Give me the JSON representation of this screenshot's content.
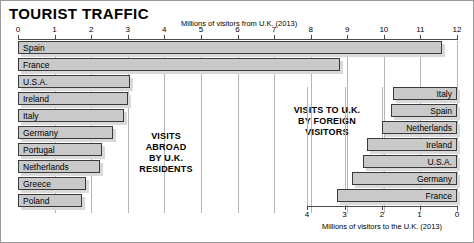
{
  "title": "TOURIST TRAFFIC",
  "captions": {
    "left": "VISITS\nABROAD\nBY U.K.\nRESIDENTS",
    "right": "VISITS TO U.K.\nBY FOREIGN\nVISITORS"
  },
  "chart_data": [
    {
      "type": "bar",
      "orientation": "horizontal",
      "title": "VISITS ABROAD BY U.K. RESIDENTS",
      "xlabel": "Millions of visitors from U.K. (2013)",
      "ylabel": "",
      "xlim": [
        0,
        12
      ],
      "xticks": [
        0,
        1,
        2,
        3,
        4,
        5,
        6,
        7,
        8,
        9,
        10,
        11,
        12
      ],
      "grid": true,
      "axis_position": "top",
      "categories": [
        "Spain",
        "France",
        "U.S.A.",
        "Ireland",
        "Italy",
        "Germany",
        "Portugal",
        "Netherlands",
        "Greece",
        "Poland"
      ],
      "values": [
        11.6,
        8.8,
        3.05,
        3.0,
        2.9,
        2.6,
        2.3,
        2.25,
        1.85,
        1.75
      ]
    },
    {
      "type": "bar",
      "orientation": "horizontal",
      "title": "VISITS TO U.K. BY FOREIGN VISITORS",
      "xlabel": "Millions of visitors to the U.K. (2013)",
      "ylabel": "",
      "xlim": [
        4,
        0
      ],
      "xticks": [
        4,
        3,
        2,
        1,
        0
      ],
      "reversed": true,
      "grid": true,
      "axis_position": "bottom",
      "categories": [
        "Italy",
        "Spain",
        "Netherlands",
        "Ireland",
        "U.S.A.",
        "Germany",
        "France"
      ],
      "values": [
        1.7,
        1.75,
        2.0,
        2.4,
        2.5,
        2.8,
        3.2
      ]
    }
  ],
  "colors": {
    "bar_fill": "#c9c9c9",
    "bar_border": "#3a3a3a",
    "shadow": "#d9d9d9",
    "gridline": "#b6b6b6",
    "axis": "#4a4a4a"
  }
}
